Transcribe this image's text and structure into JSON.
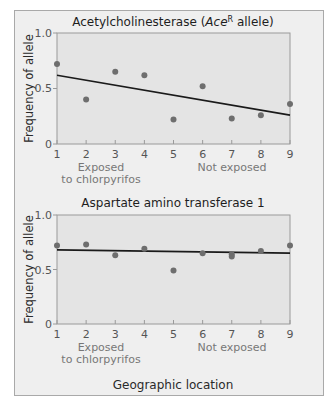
{
  "chart_data": [
    {
      "type": "scatter",
      "title": "Acetylcholinesterase (Ace^R allele)",
      "title_parts": {
        "prefix": "Acetylcholinesterase (",
        "italic": "Ace",
        "superscript": "R",
        "suffix": " allele)"
      },
      "xlabel": "Geographic location",
      "ylabel": "Frequency of allele",
      "x": [
        1,
        2,
        3,
        4,
        5,
        6,
        7,
        8,
        9
      ],
      "y": [
        0.72,
        0.4,
        0.65,
        0.62,
        0.22,
        0.52,
        0.23,
        0.26,
        0.36
      ],
      "trendline": {
        "x": [
          1,
          9
        ],
        "y": [
          0.62,
          0.26
        ]
      },
      "xlim": [
        1,
        9
      ],
      "ylim": [
        0,
        1.0
      ],
      "yticks": [
        "0",
        "0.5",
        "1.0"
      ],
      "xticks": [
        "1",
        "2",
        "3",
        "4",
        "5",
        "6",
        "7",
        "8",
        "9"
      ],
      "annotations": [
        "Exposed",
        "to chlorpyrifos",
        "Not exposed"
      ],
      "grid": false
    },
    {
      "type": "scatter",
      "title": "Aspartate amino transferase 1",
      "xlabel": "Geographic location",
      "ylabel": "Frequency of allele",
      "x": [
        1,
        2,
        3,
        4,
        5,
        6,
        7,
        7,
        8,
        9
      ],
      "y": [
        0.72,
        0.73,
        0.63,
        0.69,
        0.49,
        0.65,
        0.64,
        0.62,
        0.67,
        0.72
      ],
      "trendline": {
        "x": [
          1,
          9
        ],
        "y": [
          0.68,
          0.65
        ]
      },
      "xlim": [
        1,
        9
      ],
      "ylim": [
        0,
        1.0
      ],
      "yticks": [
        "0",
        "0.5",
        "1.0"
      ],
      "xticks": [
        "1",
        "2",
        "3",
        "4",
        "5",
        "6",
        "7",
        "8",
        "9"
      ],
      "annotations": [
        "Exposed",
        "to chlorpyrifos",
        "Not exposed"
      ],
      "grid": false
    }
  ],
  "labels": {
    "top_title_prefix": "Acetylcholinesterase (",
    "top_title_italic": "Ace",
    "top_title_sup": "R",
    "top_title_suffix": " allele)",
    "bottom_title": "Aspartate amino transferase 1",
    "ylabel": "Frequency of allele",
    "xlabel": "Geographic location",
    "exposed_line1": "Exposed",
    "exposed_line2": "to chlorpyrifos",
    "not_exposed": "Not exposed",
    "ytick_0": "0",
    "ytick_05": "0.5",
    "ytick_1": "1.0"
  },
  "colors": {
    "frame_bg": "#efefef",
    "plot_bg": "#e4e4e4",
    "point": "#6e6e6e",
    "trendline": "#1a1a1a",
    "axis": "#9a9a9a"
  }
}
